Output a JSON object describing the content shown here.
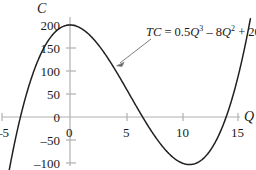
{
  "figure": {
    "axis_labels": {
      "y": "C",
      "x": "Q"
    },
    "annotation": {
      "prefix": "TC",
      "equals": " = ",
      "term1_coef": "0.5",
      "term1_var": "Q",
      "term1_exp": "3",
      "op1": " – ",
      "term2_coef": "8",
      "term2_var": "Q",
      "term2_exp": "2",
      "op2": " + ",
      "term3": "200",
      "full_text": "TC = 0.5Q³ – 8Q² + 200"
    },
    "colors": {
      "axis": "#b0b0b0",
      "curve": "#231f20",
      "text": "#1a1a1a",
      "arrow": "#6e6e6e",
      "background": "#ffffff"
    },
    "x_tick_labels": [
      "–5",
      "0",
      "5",
      "10",
      "15"
    ],
    "y_tick_labels": [
      "200",
      "150",
      "100",
      "50",
      "0",
      "–50",
      "–100"
    ],
    "origin_x_label": "0"
  },
  "chart_data": {
    "type": "line",
    "title": "",
    "subtitle": "",
    "xlabel": "Q",
    "ylabel": "C",
    "grid": false,
    "legend_position": "none",
    "xlim": [
      -6.2,
      16.6
    ],
    "ylim": [
      -125,
      215
    ],
    "xticks": [
      -5,
      0,
      5,
      10,
      15
    ],
    "yticks": [
      -100,
      -50,
      0,
      50,
      100,
      150,
      200
    ],
    "annotations": [
      {
        "text": "TC = 0.5Q³ – 8Q² + 200",
        "x": 11.5,
        "y": 186,
        "arrow_to_x": 4.2,
        "arrow_to_y": 113
      }
    ],
    "series": [
      {
        "name": "TC = 0.5Q³ – 8Q² + 200",
        "formula": "0.5*Q^3 - 8*Q^2 + 200",
        "x": [
          -5.3,
          -5.0,
          -4.5,
          -4.2,
          -4.0,
          -3.5,
          -3.0,
          -2.5,
          -2.0,
          -1.5,
          -1.0,
          -0.5,
          0.0,
          0.5,
          1.0,
          1.5,
          2.0,
          2.5,
          3.0,
          3.5,
          4.0,
          4.5,
          5.0,
          5.5,
          6.0,
          6.1,
          6.5,
          7.0,
          7.5,
          8.0,
          8.5,
          9.0,
          9.5,
          10.0,
          10.5,
          10.67,
          11.0,
          11.5,
          12.0,
          12.5,
          13.0,
          13.5,
          14.0,
          14.3,
          14.5,
          15.0,
          15.5,
          16.0
        ],
        "y": [
          -99.2,
          -82.5,
          -47.6,
          -27.6,
          -16.0,
          -19.5,
          -85.5,
          -47.8,
          -18.0,
          -5.7,
          0.0,
          198.0,
          200.0,
          198.1,
          192.5,
          183.4,
          172.0,
          157.8,
          141.5,
          123.4,
          104.0,
          83.4,
          62.5,
          41.1,
          20.0,
          13.8,
          -1.6,
          -21.5,
          -39.4,
          -56.0,
          -70.4,
          -83.5,
          -93.6,
          -100.0,
          -105.1,
          -103.5,
          -101.5,
          -96.1,
          -88.0,
          -74.2,
          -55.5,
          -31.0,
          0.0,
          19.4,
          36.1,
          87.5,
          150.4,
          222.0
        ]
      }
    ]
  }
}
